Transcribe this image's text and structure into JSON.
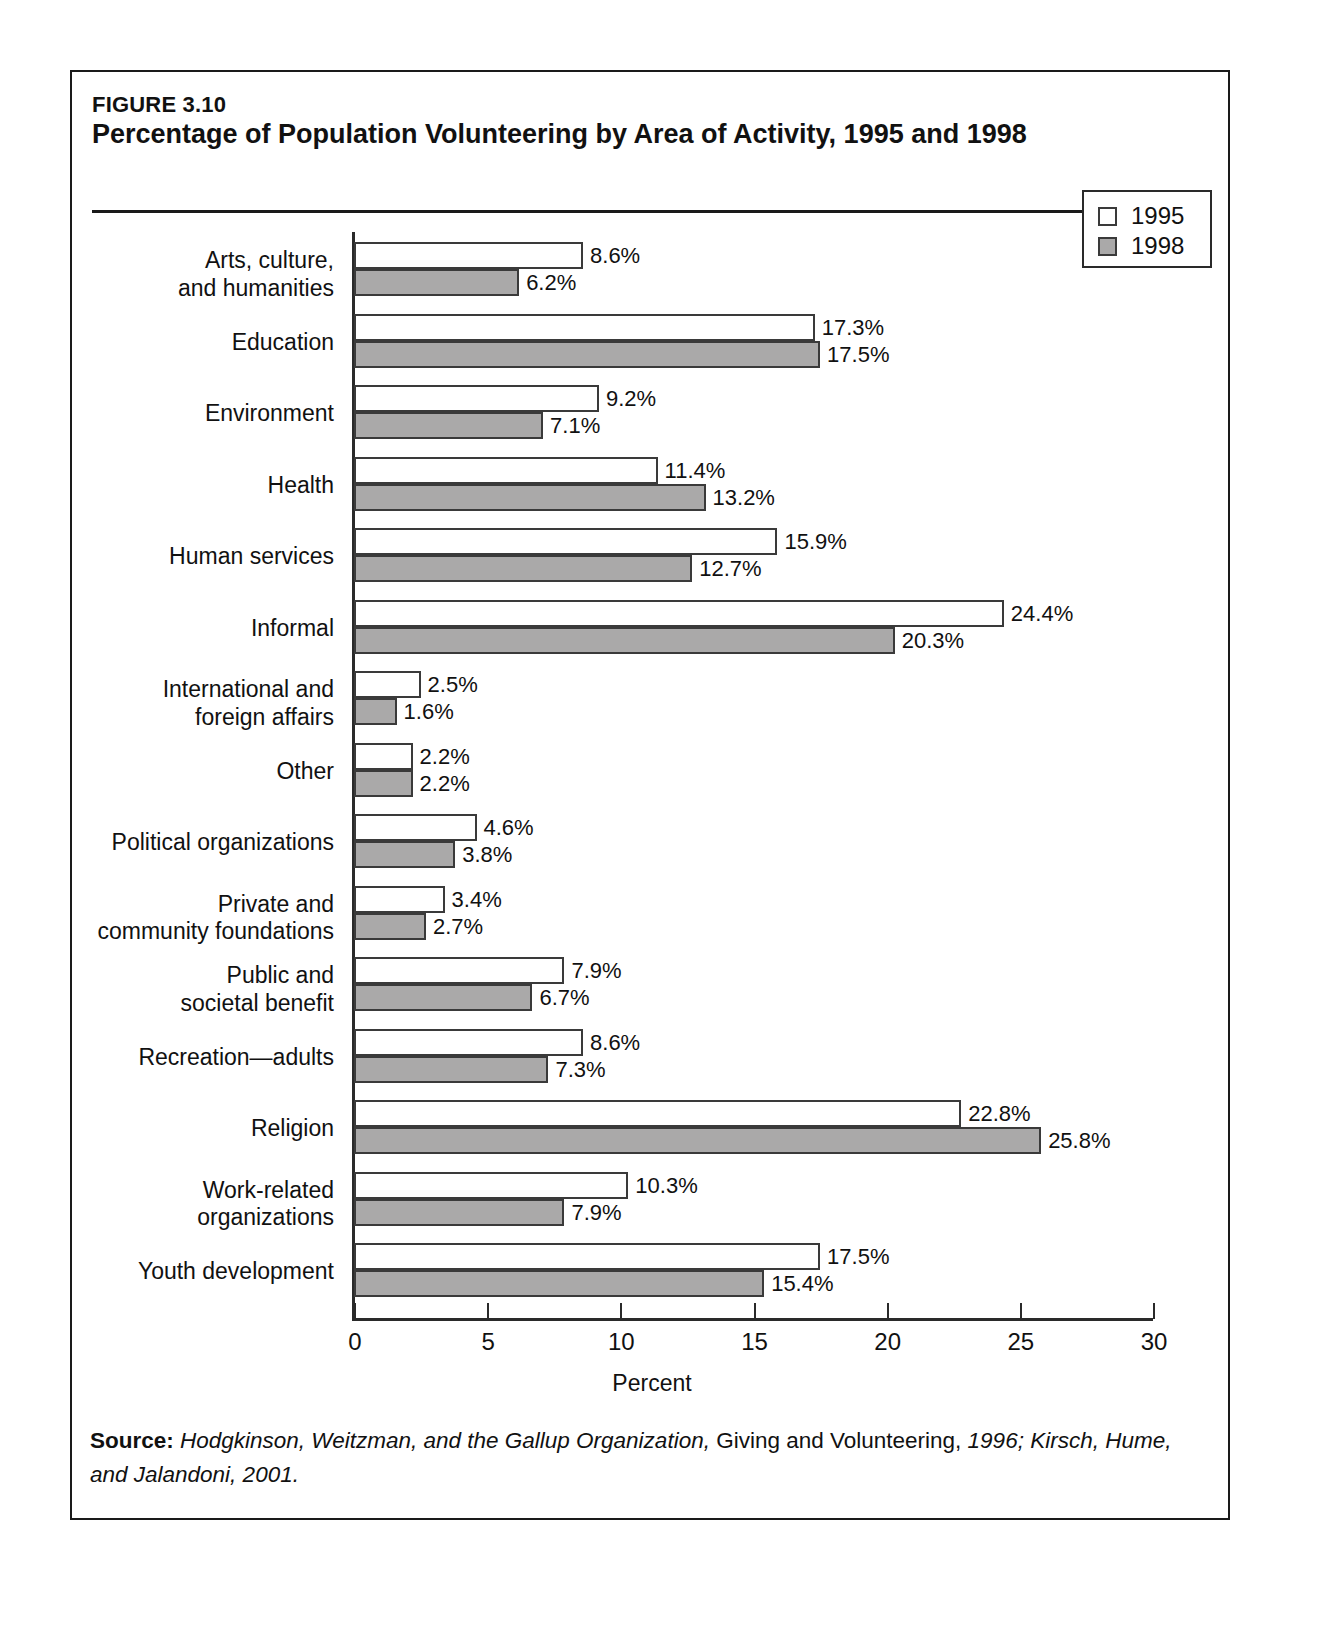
{
  "figure": {
    "number": "FIGURE 3.10",
    "title": "Percentage of Population Volunteering by Area of Activity, 1995 and 1998"
  },
  "source": {
    "lead": "Source:",
    "part1": " Hodgkinson, Weitzman, and the Gallup Organization, ",
    "part2": "Giving and Volunteering,",
    "part3": " 1996; Kirsch, Hume, and Jalandoni, 2001."
  },
  "legend": {
    "items": [
      {
        "label": "1995",
        "color": "#ffffff"
      },
      {
        "label": "1998",
        "color": "#aaa9a9"
      }
    ]
  },
  "chart_data": {
    "type": "bar",
    "orientation": "horizontal",
    "title": "Percentage of Population Volunteering by Area of Activity, 1995 and 1998",
    "xlabel": "Percent",
    "ylabel": "",
    "xlim": [
      0,
      30
    ],
    "xticks": [
      0,
      5,
      10,
      15,
      20,
      25,
      30
    ],
    "xticklabels": [
      "0",
      "5",
      "10",
      "15",
      "20",
      "25",
      "30"
    ],
    "grid": false,
    "legend_position": "top-right",
    "categories": [
      "Arts, culture,\nand humanities",
      "Education",
      "Environment",
      "Health",
      "Human services",
      "Informal",
      "International and\nforeign affairs",
      "Other",
      "Political organizations",
      "Private and\ncommunity foundations",
      "Public and\nsocietal benefit",
      "Recreation—adults",
      "Religion",
      "Work-related\norganizations",
      "Youth development"
    ],
    "series": [
      {
        "name": "1995",
        "color": "#ffffff",
        "values": [
          8.6,
          17.3,
          9.2,
          11.4,
          15.9,
          24.4,
          2.5,
          2.2,
          4.6,
          3.4,
          7.9,
          8.6,
          22.8,
          10.3,
          17.5
        ],
        "labels": [
          "8.6%",
          "17.3%",
          "9.2%",
          "11.4%",
          "15.9%",
          "24.4%",
          "2.5%",
          "2.2%",
          "4.6%",
          "3.4%",
          "7.9%",
          "8.6%",
          "22.8%",
          "10.3%",
          "17.5%"
        ]
      },
      {
        "name": "1998",
        "color": "#aaa9a9",
        "values": [
          6.2,
          17.5,
          7.1,
          13.2,
          12.7,
          20.3,
          1.6,
          2.2,
          3.8,
          2.7,
          6.7,
          7.3,
          25.8,
          7.9,
          15.4
        ],
        "labels": [
          "6.2%",
          "17.5%",
          "7.1%",
          "13.2%",
          "12.7%",
          "20.3%",
          "1.6%",
          "2.2%",
          "3.8%",
          "2.7%",
          "6.7%",
          "7.3%",
          "25.8%",
          "7.9%",
          "15.4%"
        ]
      }
    ]
  }
}
